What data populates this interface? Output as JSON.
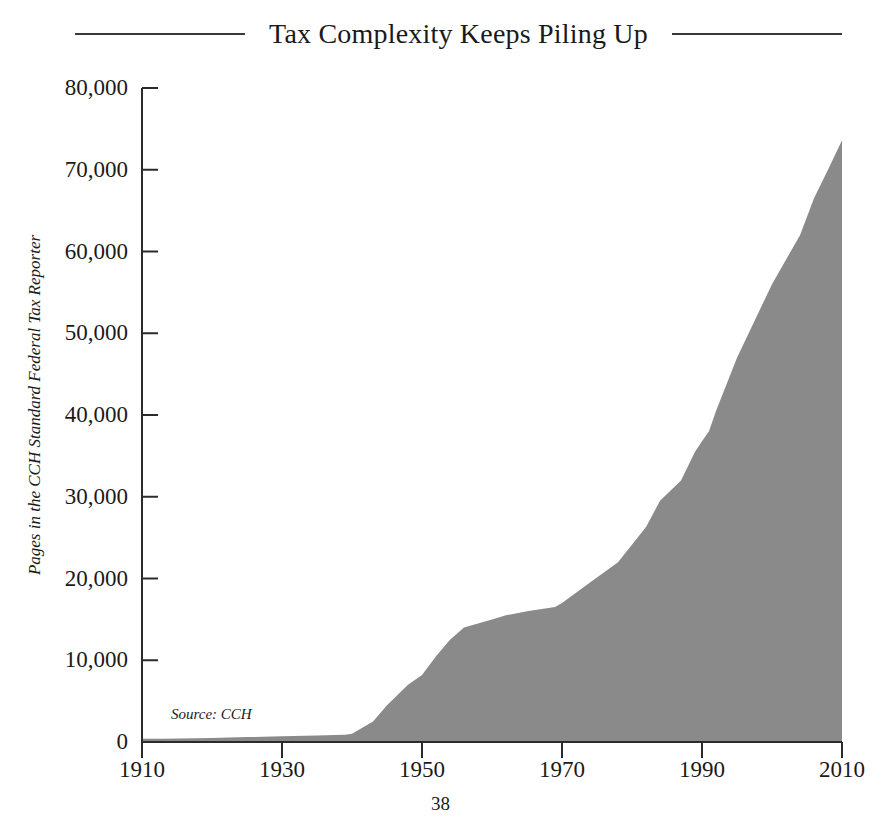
{
  "title": "Tax Complexity Keeps Piling Up",
  "page_number": "38",
  "source_note": "Source: CCH",
  "colors": {
    "area_fill": "#8a8a8a",
    "axis": "#2b2b2b",
    "text": "#1a1a1a",
    "background": "#ffffff"
  },
  "chart_data": {
    "type": "area",
    "title": "Tax Complexity Keeps Piling Up",
    "xlabel": "",
    "ylabel": "Pages in the CCH Standard Federal Tax Reporter",
    "source": "Source: CCH",
    "xlim": [
      1910,
      2010
    ],
    "ylim": [
      0,
      80000
    ],
    "grid": false,
    "legend": null,
    "x_ticks": [
      "1910",
      "1930",
      "1950",
      "1970",
      "1990",
      "2010"
    ],
    "x_tick_values": [
      1910,
      1930,
      1950,
      1970,
      1990,
      2010
    ],
    "y_ticks": [
      "0",
      "10,000",
      "20,000",
      "30,000",
      "40,000",
      "50,000",
      "60,000",
      "70,000",
      "80,000"
    ],
    "y_tick_values": [
      0,
      10000,
      20000,
      30000,
      40000,
      50000,
      60000,
      70000,
      80000
    ],
    "series": [
      {
        "name": "Pages in the CCH Standard Federal Tax Reporter",
        "x": [
          1913,
          1920,
          1925,
          1930,
          1935,
          1939,
          1940,
          1943,
          1945,
          1948,
          1950,
          1952,
          1954,
          1956,
          1958,
          1960,
          1962,
          1965,
          1969,
          1970,
          1974,
          1978,
          1982,
          1984,
          1987,
          1989,
          1990,
          1991,
          1992,
          1995,
          2000,
          2004,
          2006,
          2008,
          2010
        ],
        "y": [
          400,
          500,
          600,
          700,
          800,
          900,
          1000,
          2500,
          4500,
          7000,
          8200,
          10500,
          12500,
          14000,
          14500,
          15000,
          15500,
          16000,
          16500,
          17000,
          19500,
          22000,
          26300,
          29500,
          32000,
          35500,
          36800,
          38000,
          40500,
          47000,
          56000,
          62000,
          66500,
          70000,
          73608
        ]
      }
    ]
  },
  "y_axis_title": "Pages in the CCH Standard Federal Tax Reporter"
}
